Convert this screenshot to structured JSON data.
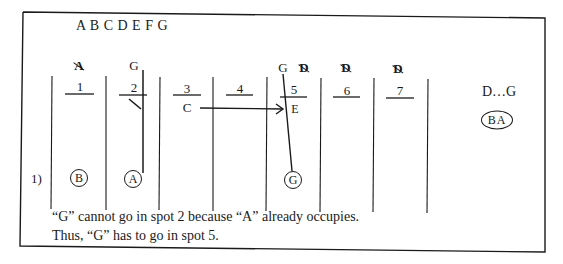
{
  "diagram": {
    "letters_header": "A B C D E F G",
    "row_label": "1)",
    "slots": [
      {
        "number": "1",
        "above": [
          {
            "text": "A",
            "crossed": true
          }
        ],
        "cell": "",
        "circled": "B"
      },
      {
        "number": "2",
        "above": [
          {
            "text": "G",
            "crossed": false
          }
        ],
        "cell": "",
        "circled": "A",
        "struck_through": true
      },
      {
        "number": "3",
        "above": [],
        "cell": "C",
        "circled": ""
      },
      {
        "number": "4",
        "above": [],
        "cell": "",
        "circled": ""
      },
      {
        "number": "5",
        "above": [
          {
            "text": "G",
            "crossed": false
          },
          {
            "text": "D",
            "crossed": true
          }
        ],
        "cell": "E",
        "circled": "G"
      },
      {
        "number": "6",
        "above": [
          {
            "text": "D",
            "crossed": true
          }
        ],
        "cell": "",
        "circled": ""
      },
      {
        "number": "7",
        "above": [
          {
            "text": "D",
            "crossed": true
          }
        ],
        "cell": "",
        "circled": ""
      }
    ],
    "arrow": {
      "from": "C",
      "from_slot": "3",
      "to": "E",
      "to_slot": "5"
    },
    "side_rule": "D…G",
    "side_group": "BA",
    "notes": [
      "“G” cannot go in spot 2 because “A” already occupies.",
      "Thus, “G” has to go in spot 5."
    ],
    "colors": {
      "ink": "#1a1a1a",
      "background": "#ffffff"
    }
  }
}
